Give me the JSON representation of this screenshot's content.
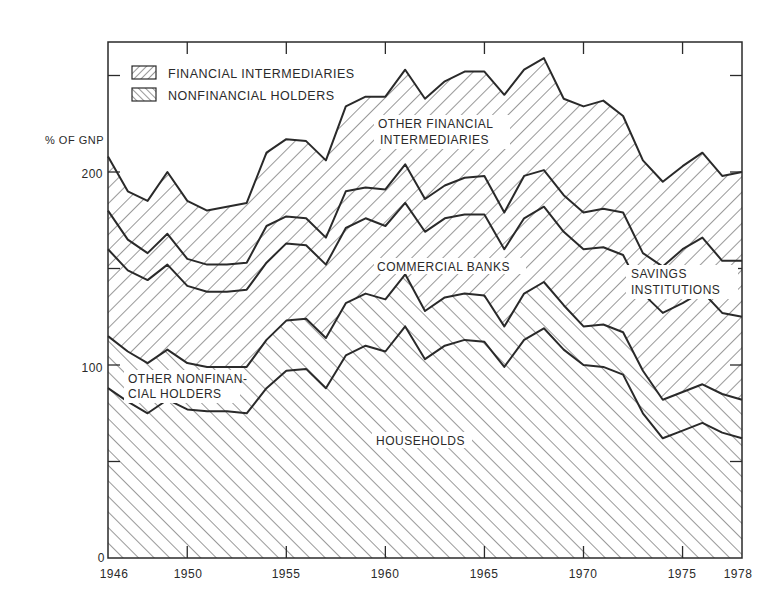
{
  "chart_data": {
    "type": "area",
    "stacked": true,
    "title": "",
    "ylabel": "% OF GNP",
    "xlabel": "",
    "xlim": [
      1946,
      1978
    ],
    "ylim": [
      0,
      270
    ],
    "x_ticks": [
      "1946",
      "1950",
      "1955",
      "1960",
      "1965",
      "1970",
      "1975",
      "1978"
    ],
    "y_ticks": [
      "0",
      "100",
      "200"
    ],
    "legend": {
      "position": "top-left",
      "entries": [
        {
          "label": "FINANCIAL INTERMEDIARIES",
          "pattern": "back-hatch"
        },
        {
          "label": "NONFINANCIAL HOLDERS",
          "pattern": "forward-hatch"
        }
      ]
    },
    "region_labels": {
      "other_financial": [
        "OTHER FINANCIAL",
        "INTERMEDIARIES"
      ],
      "commercial_banks": [
        "COMMERCIAL BANKS"
      ],
      "savings": [
        "SAVINGS",
        "INSTITUTIONS"
      ],
      "other_nonfinancial": [
        "OTHER NONFINAN-",
        "CIAL HOLDERS"
      ],
      "households": [
        "HOUSEHOLDS"
      ]
    },
    "x": [
      1946,
      1947,
      1948,
      1949,
      1950,
      1951,
      1952,
      1953,
      1954,
      1955,
      1956,
      1957,
      1958,
      1959,
      1960,
      1961,
      1962,
      1963,
      1964,
      1965,
      1966,
      1967,
      1968,
      1969,
      1970,
      1971,
      1972,
      1973,
      1974,
      1975,
      1976,
      1977,
      1978
    ],
    "series": [
      {
        "name": "HOUSEHOLDS",
        "group": "NONFINANCIAL HOLDERS",
        "values": [
          88,
          81,
          75,
          82,
          77,
          76,
          76,
          75,
          88,
          97,
          98,
          88,
          105,
          110,
          107,
          120,
          103,
          110,
          113,
          112,
          99,
          113,
          119,
          108,
          100,
          99,
          95,
          75,
          62,
          66,
          70,
          65,
          62
        ]
      },
      {
        "name": "OTHER NONFINANCIAL HOLDERS",
        "group": "NONFINANCIAL HOLDERS",
        "values": [
          27,
          26,
          26,
          26,
          24,
          23,
          23,
          24,
          25,
          26,
          26,
          26,
          27,
          27,
          27,
          27,
          25,
          25,
          24,
          24,
          21,
          24,
          24,
          23,
          20,
          22,
          22,
          22,
          20,
          20,
          20,
          20,
          20
        ]
      },
      {
        "name": "COMMERCIAL BANKS",
        "group": "FINANCIAL INTERMEDIARIES",
        "values": [
          45,
          42,
          43,
          44,
          40,
          39,
          39,
          40,
          40,
          40,
          38,
          38,
          39,
          39,
          38,
          37,
          41,
          41,
          41,
          42,
          40,
          39,
          39,
          38,
          40,
          40,
          40,
          40,
          45,
          46,
          48,
          42,
          43
        ]
      },
      {
        "name": "SAVINGS INSTITUTIONS",
        "group": "FINANCIAL INTERMEDIARIES",
        "values": [
          20,
          16,
          14,
          16,
          14,
          14,
          14,
          14,
          19,
          14,
          14,
          14,
          19,
          16,
          19,
          20,
          17,
          17,
          19,
          20,
          19,
          22,
          19,
          19,
          19,
          20,
          22,
          21,
          24,
          28,
          28,
          27,
          29
        ]
      },
      {
        "name": "OTHER FINANCIAL INTERMEDIARIES",
        "group": "FINANCIAL INTERMEDIARIES",
        "values": [
          28,
          25,
          27,
          32,
          30,
          28,
          30,
          31,
          38,
          40,
          40,
          40,
          44,
          47,
          48,
          49,
          52,
          54,
          55,
          54,
          61,
          55,
          58,
          50,
          55,
          56,
          50,
          48,
          44,
          43,
          44,
          44,
          46
        ]
      }
    ]
  },
  "labels": {
    "y_axis_title": "% OF GNP",
    "legend_fin": "FINANCIAL INTERMEDIARIES",
    "legend_nonfin": "NONFINANCIAL HOLDERS",
    "other_fin_1": "OTHER FINANCIAL",
    "other_fin_2": "INTERMEDIARIES",
    "commercial_banks": "COMMERCIAL BANKS",
    "savings_1": "SAVINGS",
    "savings_2": "INSTITUTIONS",
    "other_nonfin_1": "OTHER NONFINAN-",
    "other_nonfin_2": "CIAL HOLDERS",
    "households": "HOUSEHOLDS"
  },
  "colors": {
    "ink": "#2a2a2a",
    "paper": "#ffffff"
  }
}
